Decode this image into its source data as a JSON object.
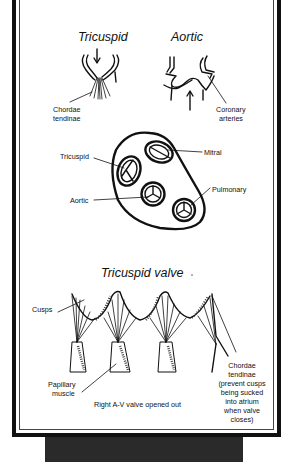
{
  "figure": {
    "top_titles": {
      "tricuspid": "Tricuspid",
      "aortic": "Aortic"
    },
    "top_labels": {
      "chordae_line1": "Chordae",
      "chordae_line2": "tendinae",
      "coronary_line1": "Coronary",
      "coronary_line2": "arteries"
    },
    "cross_section_labels": {
      "tricuspid": "Tricuspid",
      "mitral": "Mitral",
      "aortic": "Aortic",
      "pulmonary": "Pulmonary"
    },
    "bottom_title": "Tricuspid valve",
    "bottom_labels": {
      "cusps": "Cusps",
      "papillary_line1": "Papillary",
      "papillary_line2": "muscle",
      "caption": "Right A-V valve opened out",
      "chordae_note": [
        "Chordae",
        "tendinae",
        "(prevent cusps",
        "being sucked",
        "into atrium",
        "when valve",
        "closes)"
      ]
    }
  }
}
